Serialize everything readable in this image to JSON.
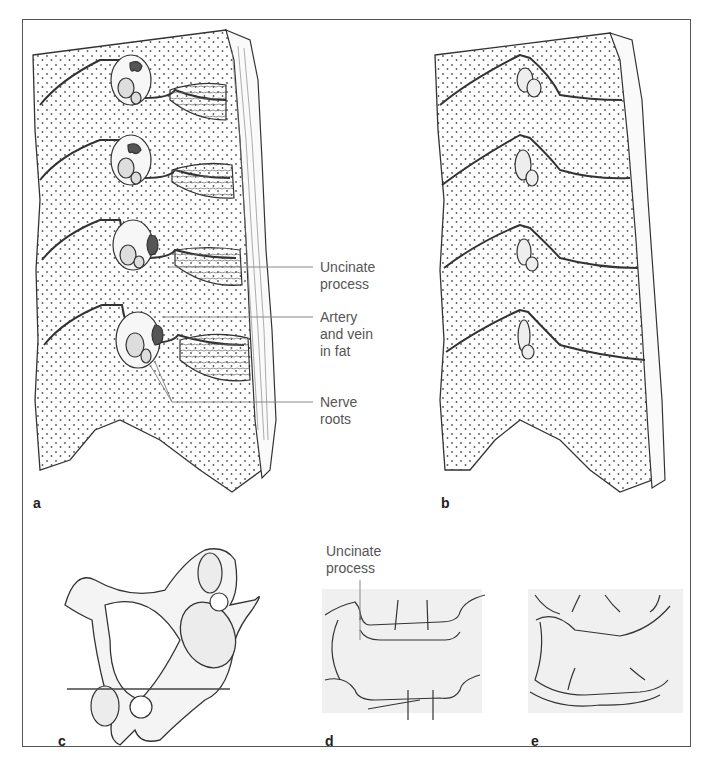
{
  "figure": {
    "panels": [
      {
        "id": "a",
        "letter": "a",
        "description": "Sagittal section of cervical spine showing intervertebral foramina with contents"
      },
      {
        "id": "b",
        "letter": "b",
        "description": "Sagittal section with narrowed intervertebral foramina"
      },
      {
        "id": "c",
        "letter": "c",
        "description": "Cervical vertebra, superior view, with section line"
      },
      {
        "id": "d",
        "letter": "d",
        "description": "Radiographic outline of vertebral bodies with uncinate process"
      },
      {
        "id": "e",
        "letter": "e",
        "description": "Radiographic outline of degenerated vertebral bodies"
      }
    ],
    "labels": {
      "uncinate_process_a_line1": "Uncinate",
      "uncinate_process_a_line2": "process",
      "artery_vein_line1": "Artery",
      "artery_vein_line2": "and vein",
      "artery_vein_line3": "in fat",
      "nerve_roots_line1": "Nerve",
      "nerve_roots_line2": "roots",
      "uncinate_process_d_line1": "Uncinate",
      "uncinate_process_d_line2": "process"
    },
    "colors": {
      "background": "#ffffff",
      "line": "#333333",
      "fill_bone": "#f2f2f2",
      "fill_vessel": "#5a5a5a",
      "fill_nerve": "#d9d9d9",
      "label_text": "#555555",
      "frame": "#555555"
    }
  }
}
